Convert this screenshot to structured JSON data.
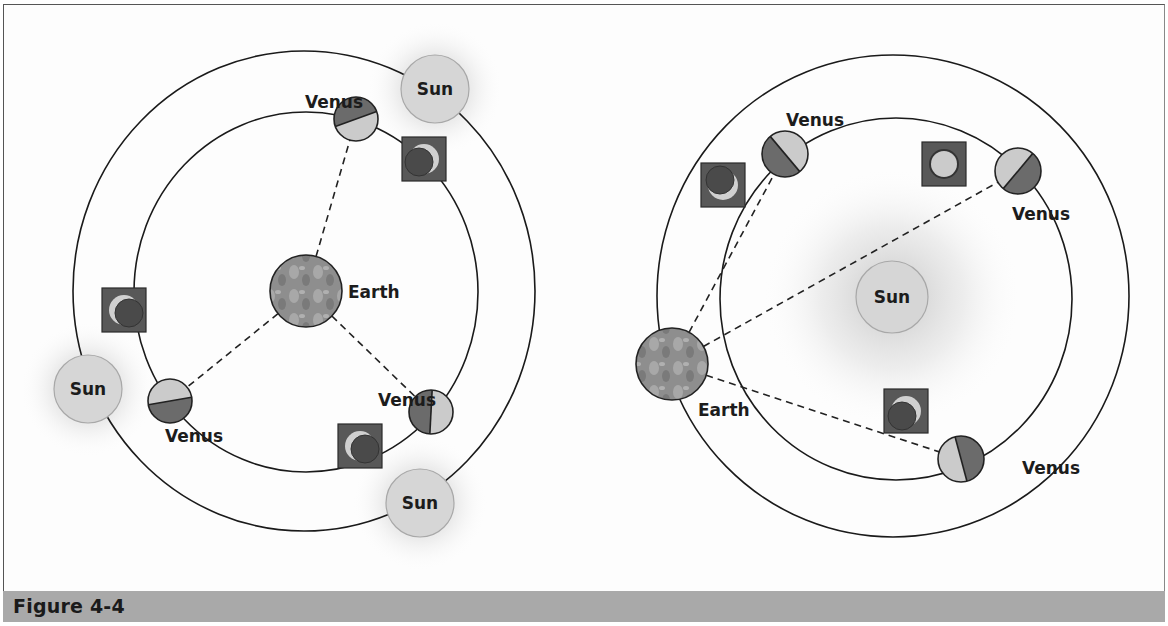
{
  "figure": {
    "caption": "Figure 4-4"
  },
  "colors": {
    "orbit": "#1a1a1a",
    "sun_fill": "#d6d6d6",
    "sun_stroke": "#a8a8a8",
    "venus_light": "#cbcbcb",
    "venus_dark": "#6b6b6b",
    "phase_box": "#585858",
    "earth": "#8c8c8c",
    "caption_bar": "#a9a9a9"
  },
  "left_diagram": {
    "title": "Geocentric (Ptolemaic) model",
    "outer_orbit": {
      "cx": 304,
      "cy": 291,
      "rx": 231,
      "ry": 240
    },
    "inner_orbit": {
      "cx": 306,
      "cy": 292,
      "rx": 172,
      "ry": 180
    },
    "earth": {
      "label": "Earth",
      "x": 306,
      "y": 291,
      "r": 36
    },
    "suns": [
      {
        "label": "Sun",
        "x": 435,
        "y": 89,
        "r": 34
      },
      {
        "label": "Sun",
        "x": 88,
        "y": 389,
        "r": 34
      },
      {
        "label": "Sun",
        "x": 420,
        "y": 503,
        "r": 34
      }
    ],
    "venus": [
      {
        "label": "Venus",
        "x": 356,
        "y": 119,
        "r": 22,
        "split_angle": 70,
        "dark_side": "left",
        "label_x": 305,
        "label_y": 108
      },
      {
        "label": "Venus",
        "x": 170,
        "y": 401,
        "r": 22,
        "split_angle": 80,
        "dark_side": "right",
        "label_x": 165,
        "label_y": 442
      },
      {
        "label": "Venus",
        "x": 431,
        "y": 412,
        "r": 22,
        "split_angle": 3,
        "dark_side": "top",
        "label_x": 378,
        "label_y": 406
      }
    ],
    "phases": [
      {
        "x": 424,
        "y": 159,
        "type": "crescent",
        "lit": "right"
      },
      {
        "x": 124,
        "y": 310,
        "type": "crescent",
        "lit": "left"
      },
      {
        "x": 360,
        "y": 446,
        "type": "crescent",
        "lit": "left"
      }
    ]
  },
  "right_diagram": {
    "title": "Heliocentric (Copernican) model",
    "outer_orbit": {
      "cx": 893,
      "cy": 296,
      "rx": 236,
      "ry": 241
    },
    "inner_orbit": {
      "cx": 896,
      "cy": 299,
      "rx": 176,
      "ry": 181
    },
    "sun": {
      "label": "Sun",
      "x": 892,
      "y": 297,
      "r": 36
    },
    "earth": {
      "label": "Earth",
      "x": 672,
      "y": 364,
      "r": 36
    },
    "venus": [
      {
        "label": "Venus",
        "x": 785,
        "y": 154,
        "r": 23,
        "split_angle": -40,
        "dark_side": "top",
        "label_x": 786,
        "label_y": 126
      },
      {
        "label": "Venus",
        "x": 1018,
        "y": 171,
        "r": 23,
        "split_angle": 40,
        "dark_side": "top",
        "label_x": 1012,
        "label_y": 220
      },
      {
        "label": "Venus",
        "x": 961,
        "y": 459,
        "r": 23,
        "split_angle": -15,
        "dark_side": "bottom",
        "label_x": 1022,
        "label_y": 474
      }
    ],
    "phases": [
      {
        "x": 723,
        "y": 185,
        "type": "crescent",
        "lit": "bottom"
      },
      {
        "x": 944,
        "y": 164,
        "type": "full",
        "lit": "all"
      },
      {
        "x": 906,
        "y": 411,
        "type": "crescent",
        "lit": "top-right"
      }
    ]
  }
}
